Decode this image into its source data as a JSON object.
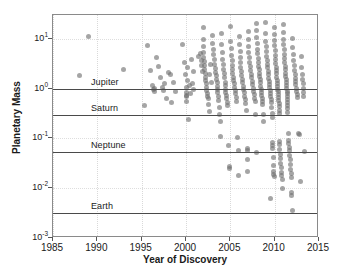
{
  "chart_data": {
    "type": "scatter",
    "title": "",
    "xlabel": "Year of Discovery",
    "ylabel": "Planetary Mass",
    "xlim": [
      1985,
      2015
    ],
    "ylim": [
      0.001,
      30
    ],
    "yscale": "log",
    "xticks": [
      "1985",
      "1990",
      "1995",
      "2000",
      "2005",
      "2010",
      "2015"
    ],
    "ytick_labels": [
      "10³⁻",
      "10¹",
      "10⁰",
      "10⁻¹",
      "10⁻²",
      "10⁻³"
    ],
    "yticks": [
      10,
      1,
      0.1,
      0.01,
      0.001
    ],
    "ytick_text": [
      {
        "mantissa": "10",
        "exponent": "1",
        "value": 10
      },
      {
        "mantissa": "10",
        "exponent": "0",
        "value": 1
      },
      {
        "mantissa": "10",
        "exponent": "-1",
        "value": 0.1
      },
      {
        "mantissa": "10",
        "exponent": "-2",
        "value": 0.01
      },
      {
        "mantissa": "10",
        "exponent": "-3",
        "value": 0.001
      }
    ],
    "grid": true,
    "legend": "none",
    "marker_color": "#6e6e6e",
    "marker_opacity": 0.62,
    "reference_lines": [
      {
        "label": "Jupiter",
        "value": 1.0
      },
      {
        "label": "Saturn",
        "value": 0.3
      },
      {
        "label": "Neptune",
        "value": 0.054
      },
      {
        "label": "Earth",
        "value": 0.00315
      }
    ],
    "points": [
      [
        1988.0,
        1.8
      ],
      [
        1989.0,
        11.0
      ],
      [
        1993.0,
        2.4
      ],
      [
        1995.3,
        0.45
      ],
      [
        1995.7,
        7.2
      ],
      [
        1996.0,
        2.3
      ],
      [
        1996.2,
        1.15
      ],
      [
        1996.3,
        0.95
      ],
      [
        1996.4,
        1.02
      ],
      [
        1996.5,
        0.88
      ],
      [
        1996.7,
        4.2
      ],
      [
        1996.9,
        2.8
      ],
      [
        1997.1,
        1.7
      ],
      [
        1997.3,
        1.05
      ],
      [
        1997.5,
        0.92
      ],
      [
        1997.6,
        1.25
      ],
      [
        1997.8,
        0.62
      ],
      [
        1998.0,
        2.1
      ],
      [
        1998.2,
        1.9
      ],
      [
        1998.4,
        0.52
      ],
      [
        1998.6,
        1.35
      ],
      [
        1998.8,
        0.88
      ],
      [
        1999.6,
        7.5
      ],
      [
        1999.8,
        3.3
      ],
      [
        1999.9,
        1.9
      ],
      [
        2000.0,
        1.05
      ],
      [
        2000.0,
        0.85
      ],
      [
        2000.0,
        0.72
      ],
      [
        2000.1,
        0.68
      ],
      [
        2000.1,
        0.55
      ],
      [
        2000.2,
        1.45
      ],
      [
        2000.2,
        2.6
      ],
      [
        2000.3,
        0.24
      ],
      [
        2000.4,
        1.15
      ],
      [
        2000.5,
        0.78
      ],
      [
        2000.6,
        3.9
      ],
      [
        2000.7,
        1.25
      ],
      [
        2000.8,
        0.95
      ],
      [
        2000.9,
        2.2
      ],
      [
        2001.4,
        4.5
      ],
      [
        2001.6,
        5.0
      ],
      [
        2001.7,
        3.6
      ],
      [
        2001.8,
        2.9
      ],
      [
        2001.9,
        2.2
      ],
      [
        2002.0,
        17.0
      ],
      [
        2002.0,
        9.5
      ],
      [
        2002.0,
        7.0
      ],
      [
        2002.0,
        5.4
      ],
      [
        2002.0,
        4.3
      ],
      [
        2002.1,
        3.5
      ],
      [
        2002.1,
        2.9
      ],
      [
        2002.1,
        2.4
      ],
      [
        2002.2,
        2.0
      ],
      [
        2002.2,
        1.7
      ],
      [
        2002.2,
        1.45
      ],
      [
        2002.3,
        1.25
      ],
      [
        2002.3,
        1.05
      ],
      [
        2002.3,
        0.92
      ],
      [
        2002.4,
        0.8
      ],
      [
        2002.4,
        0.7
      ],
      [
        2002.5,
        0.62
      ],
      [
        2002.5,
        0.48
      ],
      [
        2002.6,
        0.35
      ],
      [
        2002.7,
        1.9
      ],
      [
        2002.8,
        3.0
      ],
      [
        2002.9,
        1.35
      ],
      [
        2003.0,
        11.5
      ],
      [
        2003.0,
        8.0
      ],
      [
        2003.1,
        6.0
      ],
      [
        2003.1,
        4.8
      ],
      [
        2003.2,
        3.8
      ],
      [
        2003.2,
        3.1
      ],
      [
        2003.3,
        2.5
      ],
      [
        2003.3,
        2.1
      ],
      [
        2003.4,
        1.8
      ],
      [
        2003.4,
        1.5
      ],
      [
        2003.5,
        1.3
      ],
      [
        2003.5,
        1.1
      ],
      [
        2003.6,
        0.95
      ],
      [
        2003.6,
        0.82
      ],
      [
        2003.7,
        0.7
      ],
      [
        2003.7,
        0.58
      ],
      [
        2003.8,
        0.42
      ],
      [
        2003.8,
        0.3
      ],
      [
        2003.9,
        0.22
      ],
      [
        2003.9,
        0.11
      ],
      [
        2004.0,
        13.0
      ],
      [
        2004.0,
        7.5
      ],
      [
        2004.1,
        5.2
      ],
      [
        2004.1,
        3.9
      ],
      [
        2004.2,
        3.0
      ],
      [
        2004.2,
        2.4
      ],
      [
        2004.3,
        2.0
      ],
      [
        2004.3,
        1.65
      ],
      [
        2004.4,
        1.35
      ],
      [
        2004.4,
        1.15
      ],
      [
        2004.5,
        0.98
      ],
      [
        2004.5,
        0.85
      ],
      [
        2004.6,
        0.72
      ],
      [
        2004.6,
        0.62
      ],
      [
        2004.7,
        0.52
      ],
      [
        2004.7,
        0.45
      ],
      [
        2004.8,
        0.072
      ],
      [
        2004.9,
        0.027
      ],
      [
        2004.9,
        0.025
      ],
      [
        2005.0,
        18.0
      ],
      [
        2005.0,
        9.0
      ],
      [
        2005.1,
        6.5
      ],
      [
        2005.1,
        4.6
      ],
      [
        2005.2,
        3.6
      ],
      [
        2005.2,
        2.9
      ],
      [
        2005.3,
        2.4
      ],
      [
        2005.3,
        2.0
      ],
      [
        2005.4,
        1.7
      ],
      [
        2005.4,
        1.45
      ],
      [
        2005.5,
        1.25
      ],
      [
        2005.5,
        1.05
      ],
      [
        2005.6,
        0.9
      ],
      [
        2005.6,
        0.78
      ],
      [
        2005.7,
        0.66
      ],
      [
        2005.7,
        0.56
      ],
      [
        2005.8,
        0.105
      ],
      [
        2005.9,
        0.058
      ],
      [
        2005.9,
        0.018
      ],
      [
        2006.0,
        11.0
      ],
      [
        2006.0,
        7.8
      ],
      [
        2006.1,
        5.5
      ],
      [
        2006.1,
        4.2
      ],
      [
        2006.2,
        3.3
      ],
      [
        2006.2,
        2.7
      ],
      [
        2006.3,
        2.2
      ],
      [
        2006.3,
        1.85
      ],
      [
        2006.4,
        1.55
      ],
      [
        2006.4,
        1.3
      ],
      [
        2006.5,
        1.1
      ],
      [
        2006.5,
        0.95
      ],
      [
        2006.6,
        0.82
      ],
      [
        2006.6,
        0.7
      ],
      [
        2006.7,
        0.6
      ],
      [
        2006.7,
        0.5
      ],
      [
        2006.8,
        0.36
      ],
      [
        2006.9,
        0.062
      ],
      [
        2006.9,
        0.058
      ],
      [
        2006.9,
        0.038
      ],
      [
        2006.95,
        0.022
      ],
      [
        2007.0,
        14.0
      ],
      [
        2007.0,
        9.8
      ],
      [
        2007.1,
        7.0
      ],
      [
        2007.1,
        5.3
      ],
      [
        2007.2,
        4.2
      ],
      [
        2007.2,
        3.4
      ],
      [
        2007.3,
        2.8
      ],
      [
        2007.3,
        2.3
      ],
      [
        2007.4,
        1.95
      ],
      [
        2007.4,
        1.65
      ],
      [
        2007.5,
        1.4
      ],
      [
        2007.5,
        1.2
      ],
      [
        2007.6,
        1.02
      ],
      [
        2007.6,
        0.88
      ],
      [
        2007.7,
        0.75
      ],
      [
        2007.7,
        0.64
      ],
      [
        2007.8,
        0.55
      ],
      [
        2007.8,
        0.3
      ],
      [
        2007.9,
        0.052
      ],
      [
        2008.0,
        20.0
      ],
      [
        2008.0,
        14.5
      ],
      [
        2008.0,
        10.5
      ],
      [
        2008.1,
        8.0
      ],
      [
        2008.1,
        6.2
      ],
      [
        2008.1,
        5.0
      ],
      [
        2008.2,
        4.1
      ],
      [
        2008.2,
        3.4
      ],
      [
        2008.2,
        2.8
      ],
      [
        2008.3,
        2.4
      ],
      [
        2008.3,
        2.05
      ],
      [
        2008.3,
        1.75
      ],
      [
        2008.4,
        1.5
      ],
      [
        2008.4,
        1.3
      ],
      [
        2008.4,
        1.12
      ],
      [
        2008.5,
        0.97
      ],
      [
        2008.5,
        0.85
      ],
      [
        2008.5,
        0.74
      ],
      [
        2008.6,
        0.64
      ],
      [
        2008.6,
        0.56
      ],
      [
        2008.6,
        0.48
      ],
      [
        2008.7,
        0.3
      ],
      [
        2008.7,
        0.22
      ],
      [
        2009.0,
        21.0
      ],
      [
        2009.0,
        13.0
      ],
      [
        2009.0,
        9.0
      ],
      [
        2009.1,
        7.0
      ],
      [
        2009.1,
        5.6
      ],
      [
        2009.1,
        4.5
      ],
      [
        2009.2,
        3.7
      ],
      [
        2009.2,
        3.1
      ],
      [
        2009.2,
        2.6
      ],
      [
        2009.3,
        2.2
      ],
      [
        2009.3,
        1.9
      ],
      [
        2009.3,
        1.6
      ],
      [
        2009.4,
        1.4
      ],
      [
        2009.4,
        1.2
      ],
      [
        2009.4,
        1.05
      ],
      [
        2009.5,
        0.92
      ],
      [
        2009.5,
        0.8
      ],
      [
        2009.5,
        0.7
      ],
      [
        2009.6,
        0.61
      ],
      [
        2009.6,
        0.52
      ],
      [
        2009.6,
        0.42
      ],
      [
        2009.7,
        0.32
      ],
      [
        2009.7,
        0.26
      ],
      [
        2009.8,
        0.082
      ],
      [
        2009.8,
        0.072
      ],
      [
        2009.8,
        0.062
      ],
      [
        2009.85,
        0.042
      ],
      [
        2009.85,
        0.028
      ],
      [
        2009.9,
        0.022
      ],
      [
        2009.9,
        0.019
      ],
      [
        2009.95,
        0.017
      ],
      [
        2009.5,
        0.0062
      ],
      [
        2010.0,
        17.0
      ],
      [
        2010.0,
        12.0
      ],
      [
        2010.0,
        9.2
      ],
      [
        2010.0,
        7.2
      ],
      [
        2010.1,
        5.8
      ],
      [
        2010.1,
        4.7
      ],
      [
        2010.1,
        3.9
      ],
      [
        2010.1,
        3.2
      ],
      [
        2010.2,
        2.7
      ],
      [
        2010.2,
        2.3
      ],
      [
        2010.2,
        1.98
      ],
      [
        2010.2,
        1.7
      ],
      [
        2010.3,
        1.48
      ],
      [
        2010.3,
        1.28
      ],
      [
        2010.3,
        1.12
      ],
      [
        2010.3,
        0.98
      ],
      [
        2010.4,
        0.86
      ],
      [
        2010.4,
        0.76
      ],
      [
        2010.4,
        0.66
      ],
      [
        2010.4,
        0.58
      ],
      [
        2010.5,
        0.5
      ],
      [
        2010.5,
        0.44
      ],
      [
        2010.5,
        0.36
      ],
      [
        2010.5,
        0.31
      ],
      [
        2010.6,
        0.088
      ],
      [
        2010.6,
        0.074
      ],
      [
        2010.6,
        0.06
      ],
      [
        2010.7,
        0.048
      ],
      [
        2010.7,
        0.04
      ],
      [
        2010.7,
        0.032
      ],
      [
        2010.8,
        0.026
      ],
      [
        2010.8,
        0.021
      ],
      [
        2010.8,
        0.018
      ],
      [
        2010.9,
        0.015
      ],
      [
        2010.9,
        0.0098
      ],
      [
        2011.0,
        19.5
      ],
      [
        2011.0,
        13.5
      ],
      [
        2011.0,
        9.8
      ],
      [
        2011.0,
        7.6
      ],
      [
        2011.1,
        6.0
      ],
      [
        2011.1,
        4.9
      ],
      [
        2011.1,
        4.0
      ],
      [
        2011.1,
        3.3
      ],
      [
        2011.2,
        2.8
      ],
      [
        2011.2,
        2.4
      ],
      [
        2011.2,
        2.05
      ],
      [
        2011.2,
        1.78
      ],
      [
        2011.3,
        1.54
      ],
      [
        2011.3,
        1.34
      ],
      [
        2011.3,
        1.16
      ],
      [
        2011.3,
        1.01
      ],
      [
        2011.4,
        0.89
      ],
      [
        2011.4,
        0.78
      ],
      [
        2011.4,
        0.68
      ],
      [
        2011.4,
        0.6
      ],
      [
        2011.5,
        0.52
      ],
      [
        2011.5,
        0.45
      ],
      [
        2011.5,
        0.39
      ],
      [
        2011.5,
        0.33
      ],
      [
        2011.6,
        0.125
      ],
      [
        2011.6,
        0.09
      ],
      [
        2011.6,
        0.078
      ],
      [
        2011.7,
        0.066
      ],
      [
        2011.7,
        0.056
      ],
      [
        2011.7,
        0.046
      ],
      [
        2011.8,
        0.038
      ],
      [
        2011.8,
        0.03
      ],
      [
        2011.8,
        0.024
      ],
      [
        2011.9,
        0.02
      ],
      [
        2011.9,
        0.0165
      ],
      [
        2011.95,
        0.0082
      ],
      [
        2011.95,
        0.0072
      ],
      [
        2012.0,
        10.2
      ],
      [
        2012.0,
        6.8
      ],
      [
        2012.1,
        4.8
      ],
      [
        2012.1,
        3.6
      ],
      [
        2012.2,
        2.9
      ],
      [
        2012.2,
        2.35
      ],
      [
        2012.3,
        1.95
      ],
      [
        2012.3,
        1.62
      ],
      [
        2012.4,
        1.38
      ],
      [
        2012.4,
        1.18
      ],
      [
        2012.5,
        1.02
      ],
      [
        2012.5,
        0.88
      ],
      [
        2012.6,
        0.76
      ],
      [
        2012.6,
        0.65
      ],
      [
        2012.7,
        0.125
      ],
      [
        2012.8,
        0.118
      ],
      [
        2012.9,
        0.0135
      ],
      [
        2012.0,
        0.0035
      ],
      [
        2013.0,
        4.4
      ],
      [
        2013.0,
        2.6
      ],
      [
        2013.1,
        1.95
      ],
      [
        2013.1,
        1.55
      ],
      [
        2013.2,
        1.25
      ],
      [
        2013.2,
        1.02
      ],
      [
        2013.3,
        0.85
      ],
      [
        2013.3,
        0.7
      ],
      [
        2013.4,
        0.055
      ]
    ]
  }
}
